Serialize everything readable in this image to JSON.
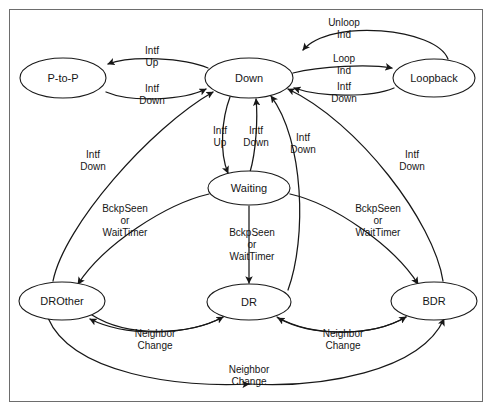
{
  "figure": {
    "border_color": "#6d6d6d",
    "line_color": "#171717",
    "node_fill": "#ffffff",
    "text_color": "#161616"
  },
  "states": [
    {
      "id": "p2p",
      "label": "P-to-P",
      "cx": 63,
      "cy": 78,
      "rx": 43,
      "ry": 20
    },
    {
      "id": "down",
      "label": "Down",
      "cx": 249,
      "cy": 78,
      "rx": 44,
      "ry": 20
    },
    {
      "id": "loopback",
      "label": "Loopback",
      "cx": 434,
      "cy": 78,
      "rx": 41,
      "ry": 19
    },
    {
      "id": "waiting",
      "label": "Waiting",
      "cx": 249,
      "cy": 188,
      "rx": 41,
      "ry": 17
    },
    {
      "id": "drother",
      "label": "DROther",
      "cx": 62,
      "cy": 301,
      "rx": 43,
      "ry": 19
    },
    {
      "id": "dr",
      "label": "DR",
      "cx": 249,
      "cy": 302,
      "rx": 42,
      "ry": 18
    },
    {
      "id": "bdr",
      "label": "BDR",
      "cx": 434,
      "cy": 301,
      "rx": 43,
      "ry": 19
    }
  ],
  "transitions": [
    {
      "id": "down-to-p2p",
      "from": "down",
      "to": "p2p",
      "label": "Intf\nUp"
    },
    {
      "id": "p2p-to-down",
      "from": "p2p",
      "to": "down",
      "label": "Intf\nDown"
    },
    {
      "id": "loopback-to-down",
      "from": "loopback",
      "to": "down",
      "label": "Unloop\nInd"
    },
    {
      "id": "down-to-loopback",
      "from": "down",
      "to": "loopback",
      "label": "Loop\nInd"
    },
    {
      "id": "loopback-down-down",
      "from": "loopback",
      "to": "down",
      "label": "Intf\nDown"
    },
    {
      "id": "down-to-waiting",
      "from": "down",
      "to": "waiting",
      "label": "Intf\nUp"
    },
    {
      "id": "waiting-to-down",
      "from": "waiting",
      "to": "down",
      "label": "Intf\nDown"
    },
    {
      "id": "dr-to-down",
      "from": "dr",
      "to": "down",
      "label": "Intf\nDown"
    },
    {
      "id": "drother-to-down",
      "from": "drother",
      "to": "down",
      "label": "Intf\nDown"
    },
    {
      "id": "bdr-to-down",
      "from": "bdr",
      "to": "down",
      "label": "Intf\nDown"
    },
    {
      "id": "waiting-to-drother",
      "from": "waiting",
      "to": "drother",
      "label": "BckpSeen\nor\nWaitTimer"
    },
    {
      "id": "waiting-to-dr",
      "from": "waiting",
      "to": "dr",
      "label": "BckpSeen\nor\nWaitTimer"
    },
    {
      "id": "waiting-to-bdr",
      "from": "waiting",
      "to": "bdr",
      "label": "BckpSeen\nor\nWaitTimer"
    },
    {
      "id": "drother-to-dr",
      "from": "drother",
      "to": "dr",
      "label": "Neighbor\nChange"
    },
    {
      "id": "dr-to-drother",
      "from": "dr",
      "to": "drother",
      "label": "Neighbor\nChange"
    },
    {
      "id": "dr-to-bdr",
      "from": "dr",
      "to": "bdr",
      "label": "Neighbor\nChange"
    },
    {
      "id": "bdr-to-dr",
      "from": "bdr",
      "to": "dr",
      "label": "Neighbor\nChange"
    },
    {
      "id": "drother-to-bdr",
      "from": "drother",
      "to": "bdr",
      "label": "Neighbor\nChange"
    }
  ],
  "edge_labels": {
    "intf_up_left": {
      "lines": [
        "Intf",
        "Up"
      ],
      "x": 152,
      "y": 54
    },
    "intf_down_left": {
      "lines": [
        "Intf",
        "Down"
      ],
      "x": 152,
      "y": 92
    },
    "unloop_ind": {
      "lines": [
        "Unloop",
        "Ind"
      ],
      "x": 344,
      "y": 26
    },
    "loop_ind": {
      "lines": [
        "Loop",
        "Ind"
      ],
      "x": 344,
      "y": 62
    },
    "intf_down_right_top": {
      "lines": [
        "Intf",
        "Down"
      ],
      "x": 344,
      "y": 90
    },
    "intf_up_center": {
      "lines": [
        "Intf",
        "Up"
      ],
      "x": 220,
      "y": 134
    },
    "intf_down_center": {
      "lines": [
        "Intf",
        "Down"
      ],
      "x": 256,
      "y": 134
    },
    "intf_down_inner": {
      "lines": [
        "Intf",
        "Down"
      ],
      "x": 303,
      "y": 141
    },
    "intf_down_far_left": {
      "lines": [
        "Intf",
        "Down"
      ],
      "x": 93,
      "y": 158
    },
    "intf_down_far_right": {
      "lines": [
        "Intf",
        "Down"
      ],
      "x": 412,
      "y": 158
    },
    "bckp_left": {
      "lines": [
        "BckpSeen",
        "or",
        "WaitTimer"
      ],
      "x": 125,
      "y": 212
    },
    "bckp_center": {
      "lines": [
        "BckpSeen",
        "or",
        "WaitTimer"
      ],
      "x": 252,
      "y": 236
    },
    "bckp_right": {
      "lines": [
        "BckpSeen",
        "or",
        "WaitTimer"
      ],
      "x": 378,
      "y": 212
    },
    "neighbor_change_l": {
      "lines": [
        "Neighbor",
        "Change"
      ],
      "x": 155,
      "y": 337
    },
    "neighbor_change_r": {
      "lines": [
        "Neighbor",
        "Change"
      ],
      "x": 343,
      "y": 337
    },
    "neighbor_change_b": {
      "lines": [
        "Neighbor",
        "Change"
      ],
      "x": 249,
      "y": 373
    }
  }
}
